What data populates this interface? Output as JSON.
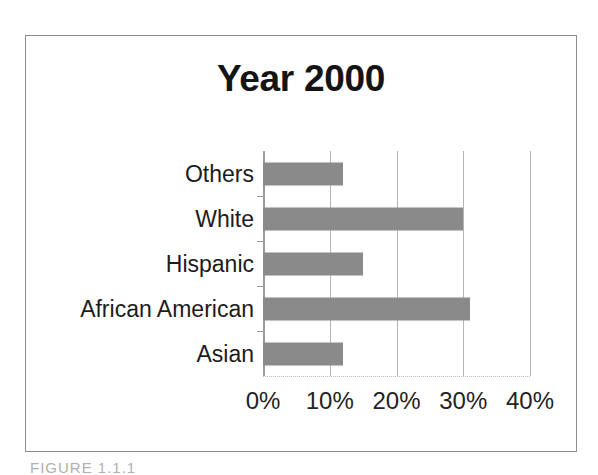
{
  "figure": {
    "caption": "FIGURE 1.1.1"
  },
  "chart_data": {
    "type": "bar",
    "orientation": "horizontal",
    "title": "Year 2000",
    "categories": [
      "Others",
      "White",
      "Hispanic",
      "African American",
      "Asian"
    ],
    "values": [
      12,
      30,
      15,
      31,
      12
    ],
    "value_labels": [
      "12%",
      "30%",
      "15%",
      "31%",
      "12%"
    ],
    "xlabel": "",
    "ylabel": "",
    "xlim": [
      0,
      40
    ],
    "xticks": [
      0,
      10,
      20,
      30,
      40
    ],
    "xtick_labels": [
      "0%",
      "10%",
      "20%",
      "30%",
      "40%"
    ],
    "grid": "vertical",
    "legend": "none",
    "bar_color": "#8a8a8a",
    "gridline_color": "#b4b4b4",
    "axis_color": "#9a9a9a",
    "title_color": "#141414",
    "background": "#ffffff"
  }
}
